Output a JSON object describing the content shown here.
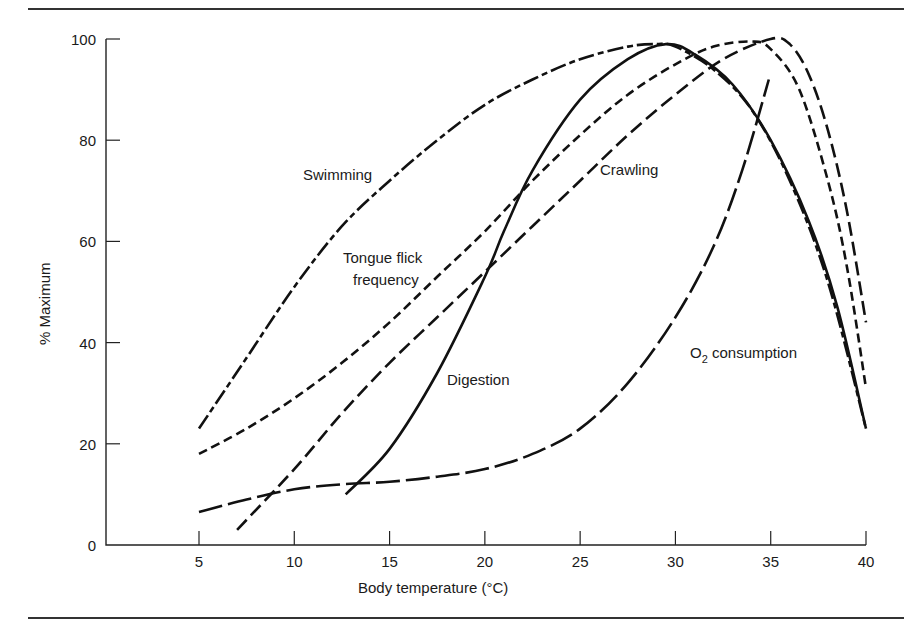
{
  "chart_data": {
    "type": "line",
    "title": "",
    "xlabel": "Body temperature (°C)",
    "ylabel": "% Maximum",
    "xlim": [
      0,
      40
    ],
    "ylim": [
      0,
      100
    ],
    "xticks": [
      5,
      10,
      15,
      20,
      25,
      30,
      35,
      40
    ],
    "yticks": [
      0,
      20,
      40,
      60,
      80,
      100
    ],
    "grid": false,
    "legend": "none (curves labeled inline)",
    "series": [
      {
        "name": "Swimming",
        "style": "dash-dot (long-short)",
        "dash": "16 4 6 4",
        "label_pos": [
          303,
          180
        ],
        "points": [
          [
            5,
            23
          ],
          [
            7.5,
            37
          ],
          [
            10,
            51
          ],
          [
            12.5,
            63
          ],
          [
            15,
            72
          ],
          [
            17.5,
            80
          ],
          [
            20,
            87
          ],
          [
            22.5,
            92
          ],
          [
            25,
            96
          ],
          [
            27.5,
            98.5
          ],
          [
            29,
            99
          ],
          [
            30,
            98.5
          ],
          [
            32,
            94
          ],
          [
            34,
            86
          ],
          [
            36,
            72
          ],
          [
            38,
            52
          ],
          [
            40,
            23
          ]
        ]
      },
      {
        "name": "Tongue flick frequency",
        "style": "short dash",
        "dash": "9 5",
        "label_lines": [
          "Tongue flick",
          "frequency"
        ],
        "label_pos": [
          343,
          263
        ],
        "points": [
          [
            5,
            18
          ],
          [
            7.5,
            23
          ],
          [
            10,
            29
          ],
          [
            12.5,
            36
          ],
          [
            15,
            44
          ],
          [
            17.5,
            53
          ],
          [
            20,
            62
          ],
          [
            22.5,
            72
          ],
          [
            25,
            81
          ],
          [
            27.5,
            89
          ],
          [
            30,
            95
          ],
          [
            32,
            98.5
          ],
          [
            34,
            99.5
          ],
          [
            35,
            98
          ],
          [
            36.5,
            90
          ],
          [
            38,
            72
          ],
          [
            39,
            55
          ],
          [
            40,
            31
          ]
        ]
      },
      {
        "name": "Crawling",
        "style": "long dash",
        "dash": "14 6",
        "label_pos": [
          600,
          175
        ],
        "points": [
          [
            7,
            3
          ],
          [
            10,
            15
          ],
          [
            12.5,
            26
          ],
          [
            15,
            36
          ],
          [
            17.5,
            45
          ],
          [
            20,
            54
          ],
          [
            22.5,
            63
          ],
          [
            25,
            72
          ],
          [
            27.5,
            81
          ],
          [
            30,
            89
          ],
          [
            32.5,
            96
          ],
          [
            35,
            100
          ],
          [
            36,
            99
          ],
          [
            37,
            93
          ],
          [
            38,
            82
          ],
          [
            39,
            66
          ],
          [
            40,
            44
          ]
        ]
      },
      {
        "name": "Digestion",
        "style": "solid",
        "dash": "",
        "label_pos": [
          447,
          385
        ],
        "points": [
          [
            12.7,
            10
          ],
          [
            15,
            19
          ],
          [
            17.5,
            34
          ],
          [
            20,
            53
          ],
          [
            21,
            62
          ],
          [
            22.5,
            74
          ],
          [
            25,
            88
          ],
          [
            27.5,
            96
          ],
          [
            29.5,
            99
          ],
          [
            31,
            97
          ],
          [
            33,
            91
          ],
          [
            35,
            80
          ],
          [
            37,
            64
          ],
          [
            38.5,
            47
          ],
          [
            40,
            23
          ]
        ]
      },
      {
        "name": "O2 consumption",
        "label_main": "O",
        "label_sub": "2",
        "label_rest": " consumption",
        "style": "very long dash",
        "dash": "24 6",
        "label_pos": [
          690,
          358
        ],
        "points": [
          [
            5,
            6.5
          ],
          [
            7.5,
            9
          ],
          [
            10,
            11
          ],
          [
            12.5,
            12
          ],
          [
            15,
            12.5
          ],
          [
            17.5,
            13.5
          ],
          [
            20,
            15
          ],
          [
            22.5,
            18
          ],
          [
            25,
            23
          ],
          [
            27.5,
            32
          ],
          [
            30,
            45
          ],
          [
            32,
            59
          ],
          [
            33.5,
            74
          ],
          [
            34.9,
            92
          ]
        ]
      }
    ]
  },
  "axes": {
    "x_ticks": [
      "5",
      "10",
      "15",
      "20",
      "25",
      "30",
      "35",
      "40"
    ],
    "y_ticks": [
      "0",
      "20",
      "40",
      "60",
      "80",
      "100"
    ],
    "xlabel": "Body temperature (°C)",
    "ylabel": "% Maximum"
  },
  "labels": {
    "swimming": "Swimming",
    "tongue_line1": "Tongue flick",
    "tongue_line2": "frequency",
    "crawling": "Crawling",
    "digestion": "Digestion",
    "o2_main": "O",
    "o2_sub": "2",
    "o2_rest": " consumption"
  }
}
